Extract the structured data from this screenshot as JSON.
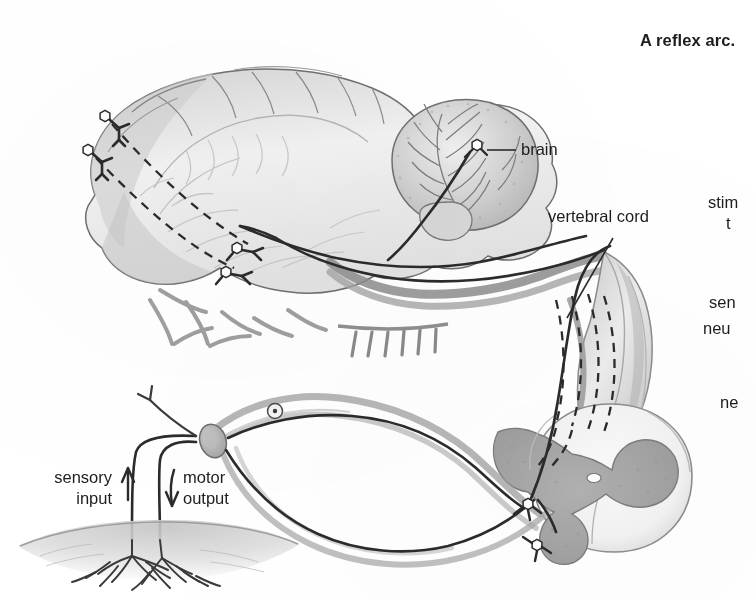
{
  "figure": {
    "title": "A reflex arc.",
    "medium": "pencil-and-ink anatomical line drawing, greyscale scan",
    "background_color": "#ffffff",
    "ink_color": "#2b2b2b",
    "tissue_fill_color": "#b9b9b9",
    "grey_matter_color": "#a8a8a8"
  },
  "labels": {
    "brain": "brain",
    "vertebral_cord": "vertebral cord",
    "sensory_input_line1": "sensory",
    "sensory_input_line2": "input",
    "motor_output_line1": "motor",
    "motor_output_line2": "output"
  },
  "truncated_labels": {
    "note": "right-hand column of labels is cut off by the page edge",
    "items": [
      {
        "text": "stim",
        "line2": "t"
      },
      {
        "text": "sen",
        "line2": "neu"
      },
      {
        "text": "ne"
      }
    ]
  },
  "structures": [
    "cerebrum",
    "cerebellum",
    "brain stem",
    "vertebral cord",
    "spinal cord cross-section",
    "grey matter butterfly",
    "dorsal root ganglion",
    "sensory neuron",
    "motor neuron",
    "skin with nerve endings"
  ],
  "neuron_markers": {
    "count": 7,
    "glyph": "star-cell-body",
    "description": "small hexagonal star cell bodies with axon branches"
  },
  "pathways": {
    "dashed": {
      "count": 4,
      "description": "dashed ascending tracts from cortex neurons to brain stem and down the vertebral cord"
    },
    "solid": {
      "description": "solid sensory and motor nerve fibres running from skin through the spinal cord"
    }
  },
  "arrows": {
    "sensory_input_direction": "up",
    "motor_output_direction": "down"
  }
}
